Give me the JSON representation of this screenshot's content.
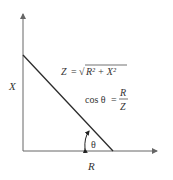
{
  "diagram": {
    "type": "impedance-triangle",
    "axis_labels": {
      "vertical": "X",
      "horizontal": "R"
    },
    "angle_label": "θ",
    "equations": {
      "impedance": {
        "lhs": "Z",
        "eq": "=",
        "sqrt_content": "R² + X²",
        "sqrt_symbol": "√"
      },
      "cosine": {
        "lhs": "cos θ",
        "eq": "=",
        "numerator": "R",
        "denominator": "Z"
      }
    },
    "colors": {
      "line": "#2a2a2a",
      "axis": "#666666",
      "text": "#333333"
    }
  }
}
